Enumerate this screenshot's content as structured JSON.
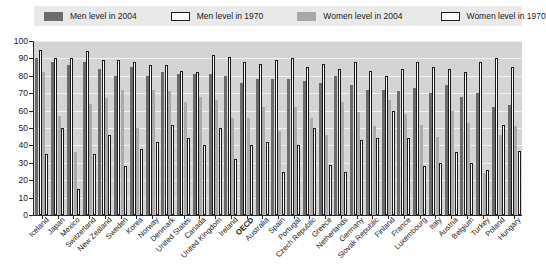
{
  "legend": {
    "items": [
      {
        "label": "Men level in 2004",
        "key": "men04",
        "color": "#6b6b6b"
      },
      {
        "label": "Men level in 1970",
        "key": "men70",
        "color": "#ffffff"
      },
      {
        "label": "Women level in 2004",
        "key": "wom04",
        "color": "#ababab"
      },
      {
        "label": "Women level in 1970",
        "key": "wom70",
        "color": "#ffffff"
      }
    ]
  },
  "chart_data": {
    "type": "bar",
    "title": "",
    "xlabel": "",
    "ylabel": "",
    "ylim": [
      0,
      100
    ],
    "yticks": [
      0,
      10,
      20,
      30,
      40,
      50,
      60,
      70,
      80,
      90,
      100
    ],
    "grid": true,
    "legend_position": "top",
    "highlight_category": "OECD",
    "categories": [
      "Iceland",
      "Japan",
      "Mexico",
      "Switzerland",
      "New Zealand",
      "Sweden",
      "Korea",
      "Norway",
      "Denmark",
      "United States",
      "Canada",
      "United Kingdom",
      "Ireland",
      "OECD",
      "Australia",
      "Spain",
      "Portugal",
      "Czech Republic",
      "Greece",
      "Netherlands",
      "Germany",
      "Slovak Republic",
      "Finland",
      "France",
      "Luxembourg",
      "Italy",
      "Austria",
      "Belgium",
      "Turkey",
      "Poland",
      "Hungary"
    ],
    "series": [
      {
        "name": "Men level in 2004",
        "key": "men04",
        "values": [
          90,
          88,
          86,
          88,
          84,
          80,
          85,
          80,
          82,
          81,
          81,
          81,
          80,
          76,
          78,
          78,
          78,
          77,
          76,
          80,
          75,
          72,
          72,
          71,
          73,
          70,
          75,
          68,
          70,
          62,
          63
        ]
      },
      {
        "name": "Men level in 1970",
        "key": "men70",
        "values": [
          95,
          90,
          90,
          94,
          89,
          89,
          88,
          86,
          86,
          83,
          82,
          92,
          91,
          88,
          87,
          89,
          90,
          85,
          87,
          84,
          88,
          83,
          80,
          84,
          88,
          85,
          84,
          82,
          88,
          90,
          85
        ]
      },
      {
        "name": "Women level in 2004",
        "key": "wom04",
        "values": [
          82,
          57,
          36,
          64,
          67,
          72,
          50,
          72,
          71,
          65,
          68,
          66,
          56,
          56,
          62,
          48,
          62,
          56,
          46,
          65,
          59,
          51,
          66,
          58,
          52,
          45,
          60,
          53,
          24,
          46,
          51
        ]
      },
      {
        "name": "Women level in 1970",
        "key": "wom70",
        "values": [
          35,
          50,
          15,
          35,
          46,
          28,
          38,
          42,
          52,
          44,
          40,
          50,
          32,
          40,
          42,
          25,
          40,
          50,
          29,
          25,
          43,
          44,
          60,
          44,
          28,
          30,
          36,
          30,
          26,
          52,
          37
        ]
      }
    ]
  }
}
